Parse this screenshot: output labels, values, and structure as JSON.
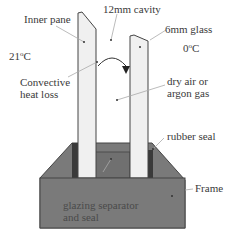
{
  "diagram": {
    "type": "cross-section",
    "labels": {
      "inner_pane": "Inner pane",
      "cavity": "12mm cavity",
      "glass": "6mm glass",
      "inside_temp_value": "21",
      "inside_temp_unit": "C",
      "outside_temp_value": "0",
      "outside_temp_unit": "C",
      "degree_mark": "o",
      "convective_line1": "Convective",
      "convective_line2": "heat loss",
      "gas_line1": "dry air or",
      "gas_line2": "argon gas",
      "rubber_seal": "rubber seal",
      "frame": "Frame",
      "separator_line1": "glazing separator",
      "separator_line2": "and seal"
    },
    "colors": {
      "background": "#ffffff",
      "glass_fill": "#f0f0f0",
      "outline": "#444444",
      "frame_fill": "#7a7a7a",
      "frame_dark": "#5e5e5e",
      "separator_fill": "#707070",
      "seal_fill": "#3a3a3a",
      "leader_line": "#aaaaaa",
      "text": "#3a3a3a"
    }
  }
}
